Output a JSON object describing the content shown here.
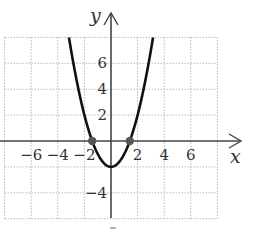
{
  "chart_data": {
    "type": "line",
    "title": "",
    "xlabel": "x",
    "ylabel": "y",
    "xlim": [
      -8,
      8
    ],
    "ylim": [
      -6,
      8
    ],
    "grid": true,
    "grid_step": 2,
    "x_tick_labels": [
      "−6",
      "−4",
      "−2",
      "2",
      "4",
      "6"
    ],
    "x_ticks": [
      -6,
      -4,
      -2,
      2,
      4,
      6
    ],
    "y_tick_labels": [
      "6",
      "4",
      "2",
      "−4"
    ],
    "y_ticks": [
      6,
      4,
      2,
      -4
    ],
    "series": [
      {
        "name": "y = x^2 - 2",
        "function": "x^2 - 2",
        "color": "#111111",
        "x": [
          -3.162,
          -3,
          -2.5,
          -2,
          -1.5,
          -1.414,
          -1,
          -0.5,
          0,
          0.5,
          1,
          1.414,
          1.5,
          2,
          2.5,
          3,
          3.162
        ],
        "y": [
          8,
          7,
          4.25,
          2,
          0.25,
          0,
          -1,
          -1.75,
          -2,
          -1.75,
          -1,
          0,
          0.25,
          2,
          4.25,
          7,
          8
        ]
      }
    ],
    "points": [
      {
        "x": -1.414,
        "y": 0,
        "label": "x-intercept"
      },
      {
        "x": 1.414,
        "y": 0,
        "label": "x-intercept"
      }
    ]
  },
  "colors": {
    "curve": "#111111",
    "axis": "#444444",
    "grid": "#b8b8b8",
    "point": "#555555"
  }
}
